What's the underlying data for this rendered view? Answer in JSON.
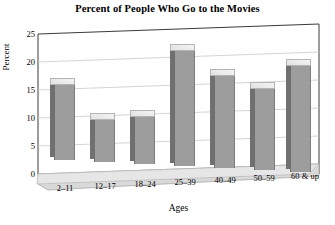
{
  "chart_data": {
    "type": "bar",
    "title": "Percent of People Who Go to the Movies",
    "xlabel": "Ages",
    "ylabel": "Percent",
    "categories": [
      "2–11",
      "12–17",
      "18–24",
      "25–39",
      "40–49",
      "50–59",
      "60 & up"
    ],
    "values": [
      14,
      8,
      9,
      21,
      17,
      15,
      19.5
    ],
    "ylim": [
      0,
      25
    ],
    "yticks": [
      "0",
      "5",
      "10",
      "15",
      "20",
      "25"
    ],
    "grid": true,
    "legend": "none",
    "style": "3d-column",
    "colors": {
      "bar_face": "#9d9d9d",
      "bar_side": "#707070",
      "bar_top": "#ededed",
      "gridline": "#c8c8c8",
      "axis": "#333333",
      "floor": "#d7d7d7",
      "background": "#ffffff"
    }
  }
}
